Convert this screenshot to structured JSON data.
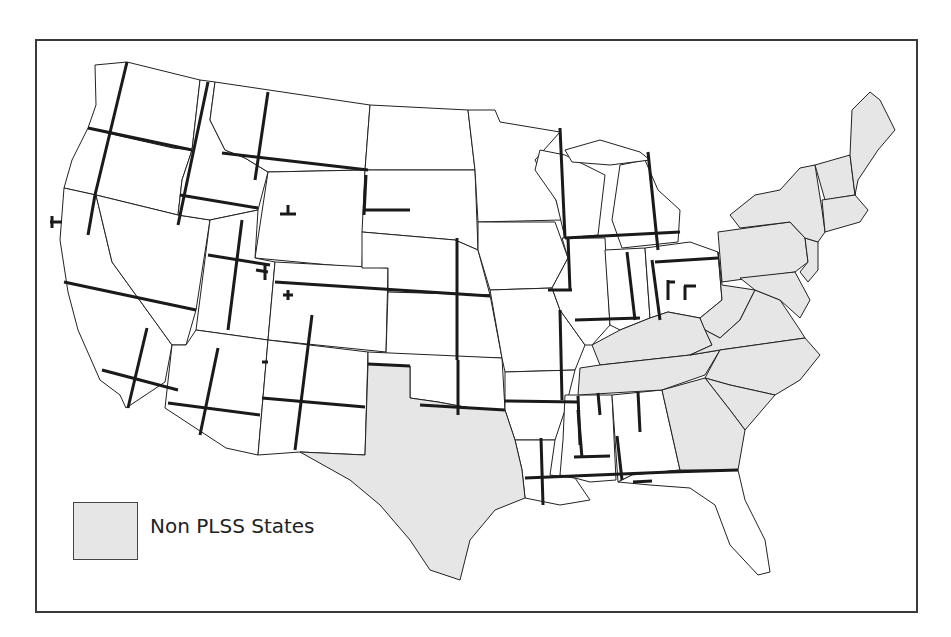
{
  "map": {
    "subject": "Public Land Survey System (PLSS) meridians and baselines of the contiguous United States",
    "colors": {
      "plss_state_fill": "#ffffff",
      "non_plss_state_fill": "#e6e6e6",
      "border": "#222222",
      "meridian_baseline_line": "#1a1a1a",
      "frame": "#3a3a3a"
    },
    "non_plss_states": [
      "Texas",
      "Kentucky",
      "Tennessee",
      "West Virginia",
      "Virginia",
      "North Carolina",
      "South Carolina",
      "Georgia",
      "Pennsylvania",
      "New York",
      "Maryland",
      "Delaware",
      "New Jersey",
      "Connecticut",
      "Rhode Island",
      "Massachusetts",
      "Vermont",
      "New Hampshire",
      "Maine"
    ]
  },
  "legend": {
    "items": [
      {
        "label": "Non PLSS States",
        "swatch_color": "#e6e6e6"
      }
    ]
  }
}
